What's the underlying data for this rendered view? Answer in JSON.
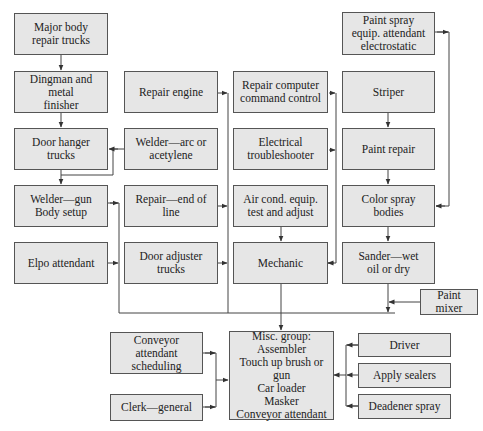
{
  "diagram": {
    "type": "flowchart",
    "boxes": {
      "major_body": "Major body\nrepair trucks",
      "dingman": "Dingman and metal\nfinisher",
      "door_hanger": "Door hanger\ntrucks",
      "welder_gun": "Welder—gun\nBody setup",
      "elpo": "Elpo attendant",
      "repair_engine": "Repair engine",
      "welder_arc": "Welder—arc or\nacetylene",
      "repair_end": "Repair—end of\nline",
      "door_adjuster": "Door adjuster\ntrucks",
      "repair_computer": "Repair computer\ncommand control",
      "electrical": "Electrical\ntroubleshooter",
      "air_cond": "Air cond. equip.\ntest and adjust",
      "mechanic": "Mechanic",
      "paint_spray": "Paint spray\nequip. attendant\nelectrostatic",
      "striper": "Striper",
      "paint_repair": "Paint repair",
      "color_spray": "Color spray\nbodies",
      "sander": "Sander—wet\noil or dry",
      "paint_mixer": "Paint mixer",
      "conveyor_sched": "Conveyor\nattendant\nscheduling",
      "clerk": "Clerk—general",
      "misc_group": "Misc. group:\nAssembler\nTouch up brush or gun\nCar loader\nMasker\nConveyor attendant",
      "driver": "Driver",
      "apply_sealers": "Apply sealers",
      "deadener": "Deadener spray"
    },
    "edges": [
      [
        "major_body",
        "dingman"
      ],
      [
        "dingman",
        "door_hanger"
      ],
      [
        "welder_arc",
        "door_hanger"
      ],
      [
        "door_hanger",
        "welder_gun"
      ],
      [
        "welder_arc",
        "welder_gun"
      ],
      [
        "repair_engine",
        "mechanic"
      ],
      [
        "repair_end",
        "mechanic"
      ],
      [
        "door_adjuster",
        "mechanic"
      ],
      [
        "welder_gun",
        "misc_group"
      ],
      [
        "elpo",
        "misc_group"
      ],
      [
        "repair_computer",
        "mechanic"
      ],
      [
        "electrical",
        "mechanic"
      ],
      [
        "air_cond",
        "mechanic"
      ],
      [
        "striper",
        "paint_repair"
      ],
      [
        "paint_repair",
        "color_spray"
      ],
      [
        "paint_spray",
        "color_spray"
      ],
      [
        "color_spray",
        "sander"
      ],
      [
        "paint_mixer",
        "misc_group"
      ],
      [
        "sander",
        "misc_group"
      ],
      [
        "mechanic",
        "misc_group"
      ],
      [
        "conveyor_sched",
        "misc_group"
      ],
      [
        "clerk",
        "misc_group"
      ],
      [
        "driver",
        "misc_group"
      ],
      [
        "apply_sealers",
        "misc_group"
      ],
      [
        "deadener",
        "misc_group"
      ]
    ]
  }
}
